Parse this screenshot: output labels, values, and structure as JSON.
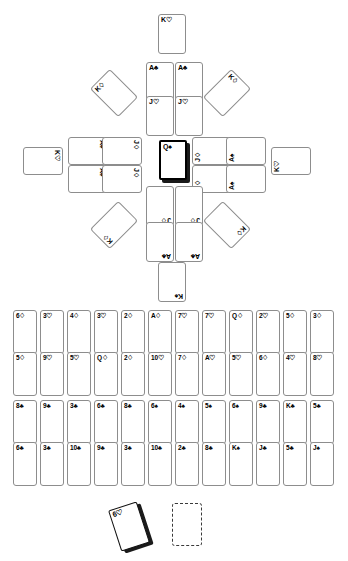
{
  "colors": {
    "background": "#ffffff",
    "card_face": "#ffffff",
    "card_border": "#8d8d8d",
    "selected_border": "#000000",
    "shadow": "#1b1b1b",
    "text": "#000000"
  },
  "mandala": {
    "name": "cross-mandala-layout",
    "cards": [
      {
        "id": "top-outer",
        "label": "K♡",
        "rank": "K",
        "suit": "hearts",
        "x": 158,
        "y": 14,
        "rot": 0,
        "selected": false
      },
      {
        "id": "top-inner-left",
        "label": "A♣",
        "rank": "A",
        "suit": "clubs",
        "x": 146,
        "y": 62,
        "rot": 0,
        "selected": false
      },
      {
        "id": "top-inner-right",
        "label": "A♣",
        "rank": "A",
        "suit": "clubs",
        "x": 175,
        "y": 62,
        "rot": 0,
        "selected": false
      },
      {
        "id": "top-mid-left",
        "label": "J♡",
        "rank": "J",
        "suit": "hearts",
        "x": 146,
        "y": 96,
        "rot": 0,
        "selected": false
      },
      {
        "id": "top-mid-right",
        "label": "J♡",
        "rank": "J",
        "suit": "hearts",
        "x": 175,
        "y": 96,
        "rot": 0,
        "selected": false
      },
      {
        "id": "left-outer",
        "label": "K♡",
        "rank": "K",
        "suit": "hearts",
        "x": 29,
        "y": 141,
        "rot": 90,
        "selected": false
      },
      {
        "id": "left-inner-top",
        "label": "A♠",
        "rank": "A",
        "suit": "spades",
        "x": 74,
        "y": 131,
        "rot": 90,
        "selected": false
      },
      {
        "id": "left-inner-bot",
        "label": "A♠",
        "rank": "A",
        "suit": "spades",
        "x": 74,
        "y": 159,
        "rot": 90,
        "selected": false
      },
      {
        "id": "left-mid-top",
        "label": "J♢",
        "rank": "J",
        "suit": "diamonds",
        "x": 108,
        "y": 131,
        "rot": 90,
        "selected": false
      },
      {
        "id": "left-mid-bot",
        "label": "J♢",
        "rank": "J",
        "suit": "diamonds",
        "x": 108,
        "y": 159,
        "rot": 90,
        "selected": false
      },
      {
        "id": "centre",
        "label": "Q♠",
        "rank": "Q",
        "suit": "spades",
        "x": 159,
        "y": 140,
        "rot": 0,
        "selected": true
      },
      {
        "id": "right-mid-top",
        "label": "J♢",
        "rank": "J",
        "suit": "diamonds",
        "x": 198,
        "y": 131,
        "rot": 270,
        "selected": false
      },
      {
        "id": "right-mid-bot",
        "label": "J♢",
        "rank": "J",
        "suit": "diamonds",
        "x": 198,
        "y": 159,
        "rot": 270,
        "selected": false
      },
      {
        "id": "right-inner-top",
        "label": "A♠",
        "rank": "A",
        "suit": "spades",
        "x": 232,
        "y": 131,
        "rot": 270,
        "selected": false
      },
      {
        "id": "right-inner-bot",
        "label": "A♠",
        "rank": "A",
        "suit": "spades",
        "x": 232,
        "y": 159,
        "rot": 270,
        "selected": false
      },
      {
        "id": "right-outer",
        "label": "K♡",
        "rank": "K",
        "suit": "hearts",
        "x": 277,
        "y": 141,
        "rot": 270,
        "selected": false
      },
      {
        "id": "bot-mid-left",
        "label": "J♢",
        "rank": "J",
        "suit": "diamonds",
        "x": 146,
        "y": 186,
        "rot": 180,
        "selected": false
      },
      {
        "id": "bot-mid-right",
        "label": "J♢",
        "rank": "J",
        "suit": "diamonds",
        "x": 175,
        "y": 186,
        "rot": 180,
        "selected": false
      },
      {
        "id": "bot-inner-left",
        "label": "A♣",
        "rank": "A",
        "suit": "clubs",
        "x": 146,
        "y": 222,
        "rot": 180,
        "selected": false
      },
      {
        "id": "bot-inner-right",
        "label": "A♣",
        "rank": "A",
        "suit": "clubs",
        "x": 175,
        "y": 222,
        "rot": 180,
        "selected": false
      },
      {
        "id": "bot-outer",
        "label": "K♠",
        "rank": "K",
        "suit": "spades",
        "x": 158,
        "y": 262,
        "rot": 180,
        "selected": false
      },
      {
        "id": "diag-top-left",
        "label": "K♢",
        "rank": "K",
        "suit": "diamonds",
        "x": 100,
        "y": 73,
        "rot": 315,
        "selected": false
      },
      {
        "id": "diag-top-right",
        "label": "K♢",
        "rank": "K",
        "suit": "diamonds",
        "x": 213,
        "y": 73,
        "rot": 45,
        "selected": false
      },
      {
        "id": "diag-bot-left",
        "label": "K♢",
        "rank": "K",
        "suit": "diamonds",
        "x": 100,
        "y": 205,
        "rot": 225,
        "selected": false
      },
      {
        "id": "diag-bot-right",
        "label": "K♢",
        "rank": "K",
        "suit": "diamonds",
        "x": 213,
        "y": 205,
        "rot": 135,
        "selected": false
      }
    ]
  },
  "grid": {
    "name": "card-grid",
    "rows": [
      {
        "id": "row-1",
        "y": 310,
        "cards": [
          "6♢",
          "3♡",
          "4♢",
          "3♡",
          "2♢",
          "A♢",
          "7♡",
          "7♡",
          "Q♢",
          "2♡",
          "5♢",
          "3♢"
        ]
      },
      {
        "id": "row-2",
        "y": 352,
        "cards": [
          "5♢",
          "9♡",
          "5♡",
          "Q♢",
          "2♢",
          "10♡",
          "7♢",
          "A♡",
          "5♡",
          "6♢",
          "4♡",
          "8♡"
        ]
      },
      {
        "id": "row-3",
        "y": 400,
        "cards": [
          "8♣",
          "9♣",
          "3♣",
          "6♣",
          "8♣",
          "6♠",
          "4♠",
          "5♠",
          "6♠",
          "9♣",
          "K♣",
          "5♣"
        ]
      },
      {
        "id": "row-4",
        "y": 442,
        "cards": [
          "6♣",
          "3♣",
          "10♣",
          "9♣",
          "3♣",
          "10♣",
          "2♣",
          "8♣",
          "K♠",
          "J♣",
          "5♣",
          "J♠"
        ]
      }
    ],
    "start_x": 13,
    "step_x": 27
  },
  "hand": {
    "name": "loose-cards-area",
    "drag_card": {
      "label": "6♡",
      "rank": "6",
      "suit": "hearts",
      "x": 114,
      "y": 505,
      "rot": -18
    },
    "drop_slot": {
      "label": "",
      "x": 172,
      "y": 503
    }
  }
}
